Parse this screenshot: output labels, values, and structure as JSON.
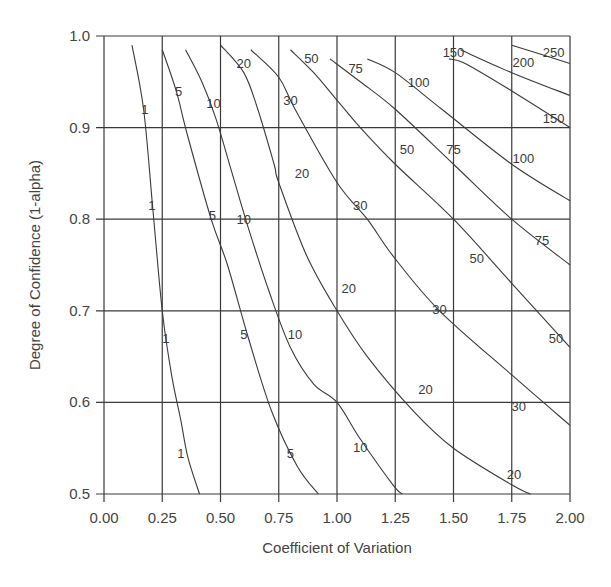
{
  "chart_data": {
    "type": "line",
    "subtype": "contour",
    "title": "",
    "xlabel": "Coefficient of Variation",
    "ylabel": "Degree of Confidence (1-alpha)",
    "xlim": [
      0.0,
      2.0
    ],
    "ylim": [
      0.5,
      1.0
    ],
    "grid": true,
    "legend": "none (inline contour labels)",
    "x_ticks": [
      "0.00",
      "0.25",
      "0.50",
      "0.75",
      "1.00",
      "1.25",
      "1.50",
      "1.75",
      "2.00"
    ],
    "y_ticks": [
      "0.5",
      "0.6",
      "0.7",
      "0.8",
      "0.9",
      "1.0"
    ],
    "series": [
      {
        "name": "1",
        "points": [
          [
            0.12,
            0.99
          ],
          [
            0.17,
            0.92
          ],
          [
            0.21,
            0.81
          ],
          [
            0.25,
            0.7
          ],
          [
            0.29,
            0.63
          ],
          [
            0.33,
            0.58
          ],
          [
            0.36,
            0.54
          ],
          [
            0.41,
            0.5
          ]
        ],
        "labels": [
          [
            0.175,
            0.92
          ],
          [
            0.205,
            0.815
          ],
          [
            0.265,
            0.67
          ],
          [
            0.33,
            0.545
          ]
        ]
      },
      {
        "name": "5",
        "points": [
          [
            0.25,
            0.985
          ],
          [
            0.31,
            0.94
          ],
          [
            0.36,
            0.89
          ],
          [
            0.46,
            0.8
          ],
          [
            0.53,
            0.75
          ],
          [
            0.62,
            0.67
          ],
          [
            0.72,
            0.59
          ],
          [
            0.83,
            0.53
          ],
          [
            0.92,
            0.5
          ]
        ],
        "labels": [
          [
            0.32,
            0.94
          ],
          [
            0.465,
            0.805
          ],
          [
            0.6,
            0.675
          ],
          [
            0.8,
            0.545
          ]
        ]
      },
      {
        "name": "10",
        "points": [
          [
            0.35,
            0.985
          ],
          [
            0.42,
            0.95
          ],
          [
            0.48,
            0.91
          ],
          [
            0.55,
            0.85
          ],
          [
            0.62,
            0.79
          ],
          [
            0.71,
            0.72
          ],
          [
            0.8,
            0.66
          ],
          [
            0.9,
            0.62
          ],
          [
            1.0,
            0.6
          ],
          [
            1.1,
            0.56
          ],
          [
            1.24,
            0.51
          ],
          [
            1.28,
            0.5
          ]
        ],
        "labels": [
          [
            0.47,
            0.927
          ],
          [
            0.6,
            0.8
          ],
          [
            0.82,
            0.675
          ],
          [
            1.1,
            0.551
          ]
        ]
      },
      {
        "name": "20",
        "points": [
          [
            0.5,
            0.99
          ],
          [
            0.6,
            0.96
          ],
          [
            0.66,
            0.92
          ],
          [
            0.73,
            0.86
          ],
          [
            0.75,
            0.84
          ],
          [
            0.87,
            0.76
          ],
          [
            1.0,
            0.7
          ],
          [
            1.13,
            0.65
          ],
          [
            1.33,
            0.59
          ],
          [
            1.5,
            0.55
          ],
          [
            1.75,
            0.51
          ],
          [
            1.83,
            0.5
          ]
        ],
        "labels": [
          [
            0.6,
            0.97
          ],
          [
            0.85,
            0.85
          ],
          [
            1.05,
            0.725
          ],
          [
            1.38,
            0.615
          ],
          [
            1.76,
            0.522
          ]
        ]
      },
      {
        "name": "30",
        "points": [
          [
            0.63,
            0.985
          ],
          [
            0.75,
            0.955
          ],
          [
            0.82,
            0.92
          ],
          [
            1.0,
            0.84
          ],
          [
            1.13,
            0.8
          ],
          [
            1.24,
            0.76
          ],
          [
            1.44,
            0.7
          ],
          [
            1.75,
            0.63
          ],
          [
            2.0,
            0.575
          ]
        ],
        "labels": [
          [
            0.8,
            0.93
          ],
          [
            1.1,
            0.815
          ],
          [
            1.44,
            0.702
          ],
          [
            1.78,
            0.596
          ]
        ]
      },
      {
        "name": "50",
        "points": [
          [
            0.8,
            0.985
          ],
          [
            0.9,
            0.96
          ],
          [
            1.0,
            0.93
          ],
          [
            1.1,
            0.9
          ],
          [
            1.25,
            0.86
          ],
          [
            1.5,
            0.8
          ],
          [
            1.75,
            0.73
          ],
          [
            2.0,
            0.66
          ]
        ],
        "labels": [
          [
            0.89,
            0.976
          ],
          [
            1.3,
            0.877
          ],
          [
            1.6,
            0.758
          ],
          [
            1.94,
            0.67
          ]
        ]
      },
      {
        "name": "75",
        "points": [
          [
            0.97,
            0.975
          ],
          [
            1.1,
            0.95
          ],
          [
            1.25,
            0.92
          ],
          [
            1.5,
            0.86
          ],
          [
            1.75,
            0.8
          ],
          [
            2.0,
            0.75
          ]
        ],
        "labels": [
          [
            1.08,
            0.965
          ],
          [
            1.5,
            0.877
          ],
          [
            1.88,
            0.777
          ]
        ]
      },
      {
        "name": "100",
        "points": [
          [
            1.13,
            0.975
          ],
          [
            1.25,
            0.96
          ],
          [
            1.45,
            0.92
          ],
          [
            1.75,
            0.86
          ],
          [
            2.0,
            0.82
          ]
        ],
        "labels": [
          [
            1.35,
            0.95
          ],
          [
            1.8,
            0.867
          ]
        ]
      },
      {
        "name": "150",
        "points": [
          [
            1.48,
            0.975
          ],
          [
            1.55,
            0.97
          ],
          [
            1.75,
            0.94
          ],
          [
            2.0,
            0.9
          ]
        ],
        "labels": [
          [
            1.5,
            0.982
          ],
          [
            1.93,
            0.911
          ]
        ]
      },
      {
        "name": "200",
        "points": [
          [
            1.53,
            0.985
          ],
          [
            1.75,
            0.96
          ],
          [
            2.0,
            0.935
          ]
        ],
        "labels": [
          [
            1.8,
            0.972
          ]
        ]
      },
      {
        "name": "250",
        "points": [
          [
            1.75,
            0.99
          ],
          [
            2.0,
            0.97
          ]
        ],
        "labels": [
          [
            1.93,
            0.982
          ]
        ]
      }
    ]
  },
  "layout": {
    "plot_left": 104,
    "plot_right": 570,
    "plot_top": 36,
    "plot_bottom": 494
  }
}
